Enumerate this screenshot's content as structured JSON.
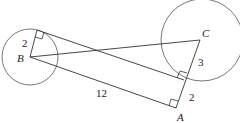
{
  "diagram": {
    "points": {
      "A": {
        "label": "A",
        "x": 176,
        "y": 108
      },
      "B": {
        "label": "B",
        "x": 30,
        "y": 57
      },
      "C": {
        "label": "C",
        "x": 200,
        "y": 40
      }
    },
    "circles": [
      {
        "name": "circle-B",
        "cx": 30,
        "cy": 57,
        "r": 28
      },
      {
        "name": "circle-C",
        "cx": 202,
        "cy": 40,
        "r": 41
      }
    ],
    "labels": {
      "radius_B": "2",
      "segment_AB": "12",
      "segment_C_tangent": "3",
      "segment_A_tangent": "2"
    },
    "stroke_color": "#444444"
  }
}
